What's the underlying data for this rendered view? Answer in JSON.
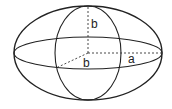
{
  "diagram": {
    "type": "ellipsoid",
    "stroke_color": "#222222",
    "background": "#ffffff",
    "labels": {
      "vertical_semi_axis": "b",
      "depth_semi_axis": "b",
      "horizontal_semi_axis": "a"
    }
  }
}
